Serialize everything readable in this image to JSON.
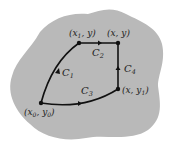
{
  "diagram": {
    "region_color": "#b9b9b9",
    "path_color": "#111111",
    "points": [
      {
        "id": "x0y0",
        "label_parts": [
          "(x",
          "0",
          ", y",
          "0",
          ")"
        ],
        "x": 41,
        "y": 103
      },
      {
        "id": "x1y",
        "label_parts": [
          "(x",
          "1",
          ", y)"
        ],
        "x": 79,
        "y": 43
      },
      {
        "id": "xy",
        "label": "(x, y)",
        "x": 118,
        "y": 43
      },
      {
        "id": "xy1",
        "label_parts": [
          "(x, y",
          "1",
          ")"
        ],
        "x": 118,
        "y": 89
      }
    ],
    "curves": [
      {
        "id": "C1",
        "name": "C",
        "sub": "1",
        "from": "x0y0",
        "to": "x1y"
      },
      {
        "id": "C2",
        "name": "C",
        "sub": "2",
        "from": "x1y",
        "to": "xy"
      },
      {
        "id": "C3",
        "name": "C",
        "sub": "3",
        "from": "x0y0",
        "to": "xy1"
      },
      {
        "id": "C4",
        "name": "C",
        "sub": "4",
        "from": "xy1",
        "to": "xy"
      }
    ]
  }
}
